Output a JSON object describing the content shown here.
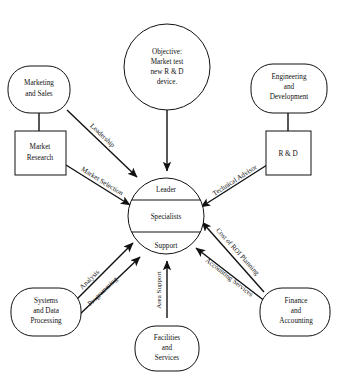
{
  "diagram": {
    "background_color": "#ffffff",
    "line_color": "#111111",
    "center": {
      "shape": "circle",
      "bands": [
        {
          "label": "Leader"
        },
        {
          "label": "Specialists"
        },
        {
          "label": "Support"
        }
      ]
    },
    "nodes": [
      {
        "id": "objective",
        "shape": "circle",
        "lines": [
          "Objective:",
          "Market test",
          "new R & D",
          "device."
        ]
      },
      {
        "id": "marketing-and-sales",
        "shape": "stadium",
        "lines": [
          "Marketing",
          "and Sales"
        ]
      },
      {
        "id": "market-research",
        "shape": "rectangle",
        "lines": [
          "Market",
          "Research"
        ]
      },
      {
        "id": "engineering-and-development",
        "shape": "stadium",
        "lines": [
          "Engineering",
          "and",
          "Development"
        ]
      },
      {
        "id": "r-and-d",
        "shape": "rectangle",
        "lines": [
          "R & D"
        ]
      },
      {
        "id": "systems-and-data-processing",
        "shape": "stadium",
        "lines": [
          "Systems",
          "and Data",
          "Processing"
        ]
      },
      {
        "id": "facilities-and-services",
        "shape": "stadium",
        "lines": [
          "Facilities",
          "and",
          "Services"
        ]
      },
      {
        "id": "finance-and-accounting",
        "shape": "stadium",
        "lines": [
          "Finance",
          "and",
          "Accounting"
        ]
      }
    ],
    "edges": [
      {
        "id": "objective-to-center",
        "label": "",
        "from": "objective",
        "to": "center",
        "arrow": true
      },
      {
        "id": "leadership",
        "label": "Leadership",
        "from": "marketing-and-sales",
        "to": "center",
        "arrow": true
      },
      {
        "id": "market-selection",
        "label": "Market Selection",
        "from": "market-research",
        "to": "center",
        "arrow": true
      },
      {
        "id": "technical-advisor",
        "label": "Technical Advisor",
        "from": "r-and-d",
        "to": "center",
        "arrow": true
      },
      {
        "id": "cost-of-roi-planning",
        "label": "Cost of ROI Planning",
        "from": "finance-and-accounting",
        "to": "center",
        "arrow": true
      },
      {
        "id": "accounting-services",
        "label": "Accounting Services",
        "from": "finance-and-accounting",
        "to": "center",
        "arrow": true
      },
      {
        "id": "area-support",
        "label": "Area Support",
        "from": "facilities-and-services",
        "to": "center",
        "arrow": true
      },
      {
        "id": "analysis",
        "label": "Analysis",
        "from": "systems-and-data-processing",
        "to": "center",
        "arrow": true
      },
      {
        "id": "programming",
        "label": "Programming",
        "from": "systems-and-data-processing",
        "to": "center",
        "arrow": true
      },
      {
        "id": "marketing-to-market-research",
        "label": "",
        "from": "marketing-and-sales",
        "to": "market-research",
        "arrow": false
      },
      {
        "id": "engineering-to-r-and-d",
        "label": "",
        "from": "engineering-and-development",
        "to": "r-and-d",
        "arrow": false
      }
    ]
  }
}
